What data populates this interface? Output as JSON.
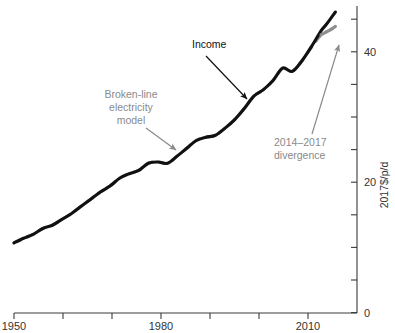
{
  "chart_data": {
    "type": "line",
    "title": "",
    "subtitle": "",
    "xlabel": "",
    "ylabel": "2017$/p/d",
    "xlim": [
      1950,
      2020
    ],
    "ylim": [
      0,
      48
    ],
    "grid": false,
    "legend_position": "none",
    "x_ticks_major": [
      1950,
      1980,
      2010
    ],
    "x_tick_labels": [
      "1950",
      "1980",
      "2010"
    ],
    "x_ticks_all": [
      1950,
      1960,
      1970,
      1980,
      1990,
      2000,
      2010
    ],
    "y_ticks_major": [
      0,
      20,
      40
    ],
    "y_tick_labels": [
      "0",
      "20",
      "40"
    ],
    "y_ticks_all": [
      0,
      5,
      10,
      15,
      20,
      25,
      30,
      35,
      40,
      45
    ],
    "x": [
      1950,
      1952,
      1954,
      1956,
      1958,
      1960,
      1962,
      1964,
      1966,
      1968,
      1970,
      1972,
      1974,
      1976,
      1978,
      1980,
      1982,
      1984,
      1986,
      1988,
      1990,
      1992,
      1994,
      1996,
      1998,
      2000,
      2002,
      2004,
      2006,
      2008,
      2010,
      2012,
      2014,
      2015,
      2016,
      2017
    ],
    "series": [
      {
        "name": "Income",
        "color": "#111111",
        "style": "solid",
        "values": [
          10.7,
          11.4,
          12.0,
          12.9,
          13.4,
          14.3,
          15.2,
          16.3,
          17.4,
          18.5,
          19.4,
          20.6,
          21.3,
          21.8,
          22.9,
          23.1,
          22.9,
          24.0,
          25.2,
          26.4,
          26.9,
          27.2,
          28.3,
          29.6,
          31.3,
          33.2,
          34.2,
          35.6,
          37.5,
          37.0,
          38.6,
          40.8,
          43.2,
          44.1,
          45.1,
          46.1
        ]
      },
      {
        "name": "Broken-line electricity model",
        "color": "#8e8e8e",
        "style": "solid",
        "values": [
          10.7,
          11.4,
          12.0,
          12.9,
          13.4,
          14.3,
          15.2,
          16.3,
          17.4,
          18.5,
          19.4,
          20.6,
          21.3,
          21.8,
          22.9,
          23.1,
          22.9,
          24.0,
          25.2,
          26.4,
          26.9,
          27.2,
          28.3,
          29.6,
          31.3,
          33.2,
          34.2,
          35.6,
          37.5,
          37.0,
          38.6,
          40.7,
          42.6,
          43.0,
          43.4,
          43.9
        ]
      }
    ],
    "annotations": [
      {
        "id": "income-label",
        "text": "Income",
        "color": "#111111",
        "text_x": 192,
        "text_y": 48,
        "arrow_from": [
          208,
          56
        ],
        "arrow_to": [
          248,
          101
        ]
      },
      {
        "id": "model-label",
        "text_lines": [
          "Broken-line",
          "electricity",
          "model"
        ],
        "color": "#8a8a8a",
        "text_x": 93,
        "text_y": 98,
        "arrow_from": [
          147,
          124
        ],
        "arrow_to": [
          177,
          149
        ]
      },
      {
        "id": "divergence-label",
        "text_lines": [
          "2014–2017",
          "divergence"
        ],
        "color": "#8a8a8a",
        "text_x": 275,
        "text_y": 146,
        "arrow_from": [
          312,
          135
        ],
        "arrow_to": [
          340,
          44
        ]
      }
    ]
  },
  "axis": {
    "y_label": "2017$/p/d",
    "y_tick_40": "40",
    "y_tick_20": "20",
    "y_tick_0": "0",
    "x_tick_1950": "1950",
    "x_tick_1980": "1980",
    "x_tick_2010": "2010"
  },
  "annotations": {
    "income": "Income",
    "model_line1": "Broken-line",
    "model_line2": "electricity",
    "model_line3": "model",
    "divergence_line1": "2014–2017",
    "divergence_line2": "divergence"
  },
  "colors": {
    "income_series": "#111111",
    "model_series": "#8e8e8e",
    "axis": "#3a3a3a",
    "gray_text": "#8a8a8a",
    "black_text": "#111111",
    "background": "#ffffff"
  }
}
